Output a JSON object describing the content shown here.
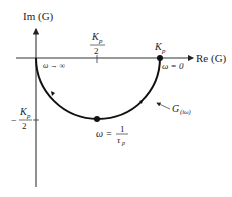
{
  "diagram": {
    "type": "nyquist-plot",
    "axes": {
      "x_label": "Re (G)",
      "y_label": "Im (G)"
    },
    "curve_label": "G(iω)",
    "curve_label_main": "G",
    "curve_label_sub": "(iω)",
    "ticks": {
      "x_half": {
        "num": "K",
        "num_sub": "p",
        "den": "2"
      },
      "y_neg_half": {
        "sign": "−",
        "num": "K",
        "num_sub": "p",
        "den": "2"
      }
    },
    "points": {
      "kp_label": "K",
      "kp_label_sub": "p",
      "omega_zero": "ω = 0",
      "omega_inf": "ω → ∞",
      "omega_mid_prefix": "ω =",
      "omega_mid_num": "1",
      "omega_mid_den": "τ",
      "omega_mid_den_sub": "p"
    },
    "colors": {
      "line": "#111111",
      "axis": "#333333",
      "background": "#ffffff"
    }
  }
}
